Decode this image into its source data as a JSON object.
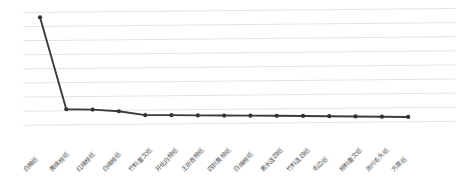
{
  "chart_data": {
    "type": "line",
    "title": "",
    "subtitle": "",
    "xlabel": "",
    "ylabel": "",
    "grid": true,
    "legend": "none",
    "gridline_count": 9,
    "ylim": [
      0,
      9
    ],
    "categories": [
      "白棉纸",
      "黄绵榜纸",
      "红绵榜纸",
      "白绵榜纸",
      "竹料重文纸",
      "开化白榜纸",
      "王折青榜纸",
      "四折黄榜纸",
      "白绵榜纸",
      "素水连四纸",
      "竹料连四纸",
      "毛边纸",
      "榜料重文纸",
      "池州毛头纸",
      "方票纸"
    ],
    "values": [
      8.6,
      1.25,
      1.2,
      1.05,
      0.72,
      0.7,
      0.66,
      0.63,
      0.6,
      0.57,
      0.54,
      0.5,
      0.46,
      0.42,
      0.38
    ],
    "series": [
      {
        "name": "价格",
        "values": [
          8.6,
          1.25,
          1.2,
          1.05,
          0.72,
          0.7,
          0.66,
          0.63,
          0.6,
          0.57,
          0.54,
          0.5,
          0.46,
          0.42,
          0.38
        ]
      }
    ],
    "line_color": "#3b3b3b",
    "marker_color": "#333333",
    "gridline_color": "#d9d9d9"
  }
}
